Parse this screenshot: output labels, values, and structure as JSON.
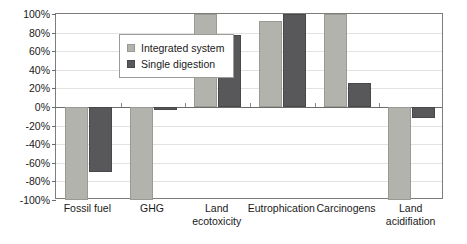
{
  "chart_data": {
    "type": "bar",
    "title": "",
    "subtitle": "",
    "xlabel": "",
    "ylabel": "",
    "ylim": [
      -100,
      100
    ],
    "ytick_values": [
      100,
      80,
      60,
      40,
      20,
      0,
      -20,
      -40,
      -60,
      -80,
      -100
    ],
    "ytick_labels": [
      "100%",
      "80%",
      "60%",
      "40%",
      "20%",
      "0%",
      "-20%",
      "-40%",
      "-60%",
      "-80%",
      "-100%"
    ],
    "grid": true,
    "legend_position": "top-left",
    "categories": [
      "Fossil fuel",
      "GHG",
      "Land\necotoxicity",
      "Eutrophication",
      "Carcinogens",
      "Land\nacidifiation"
    ],
    "series": [
      {
        "name": "Integrated system",
        "color": "#b3b3ae",
        "values": [
          -100,
          -100,
          100,
          93,
          100,
          -100
        ]
      },
      {
        "name": "Single digestion",
        "color": "#58585a",
        "values": [
          -70,
          -3,
          77,
          100,
          26,
          -12
        ]
      }
    ]
  },
  "legend": {
    "items": [
      {
        "label": "Integrated system",
        "swatch": "light-gray-swatch"
      },
      {
        "label": "Single digestion",
        "swatch": "dark-gray-swatch"
      }
    ]
  },
  "colors": {
    "series_light": "#b3b3ae",
    "series_dark": "#58585a",
    "axis": "#6b6b6b",
    "grid": "#e2e2e2",
    "frame": "#7d7d7d",
    "background": "#ffffff",
    "text": "#1a1a1a"
  }
}
